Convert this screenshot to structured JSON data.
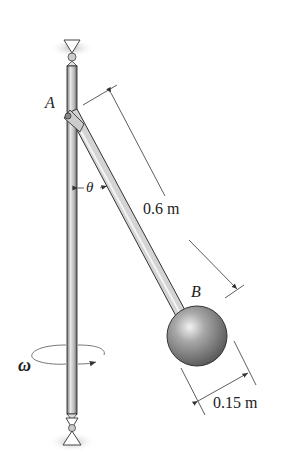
{
  "diagram": {
    "labels": {
      "pin_a": "A",
      "ball_b": "B",
      "angle": "θ",
      "angular_velocity": "ω",
      "rod_length": "0.6 m",
      "ball_diameter": "0.15 m"
    },
    "colors": {
      "shaft": "#b8b8b8",
      "shaft_edge": "#333333",
      "ball": "#8a8a8a",
      "dimension_line": "#333333"
    }
  }
}
